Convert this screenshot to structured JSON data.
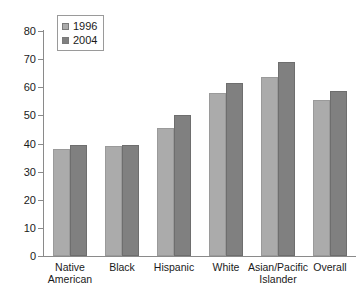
{
  "chart_data": {
    "type": "bar",
    "title": "",
    "subtitle": "",
    "xlabel": "",
    "ylabel": "",
    "ylim": [
      0,
      80
    ],
    "yticks": [
      0,
      10,
      20,
      30,
      40,
      50,
      60,
      70,
      80
    ],
    "grid": false,
    "legend_position": "top-left",
    "categories": [
      "Native\nAmerican",
      "Black",
      "Hispanic",
      "White",
      "Asian/Pacific\nIslander",
      "Overall"
    ],
    "series": [
      {
        "name": "1996",
        "color": "#ababab",
        "values": [
          38,
          39,
          45.5,
          58,
          63.5,
          55.5
        ]
      },
      {
        "name": "2004",
        "color": "#808080",
        "values": [
          39.5,
          39.5,
          50,
          61.5,
          69,
          58.5
        ]
      }
    ]
  },
  "legend": {
    "entries": [
      {
        "label": "1996"
      },
      {
        "label": "2004"
      }
    ]
  },
  "axis": {
    "y_tick_labels": [
      "80",
      "70",
      "60",
      "50",
      "40",
      "30",
      "20",
      "10",
      "0"
    ]
  },
  "colors": {
    "series_1996": "#ababab",
    "series_2004": "#808080",
    "axis": "#8a8a8a",
    "text": "#1a1a1a",
    "background": "#ffffff"
  }
}
